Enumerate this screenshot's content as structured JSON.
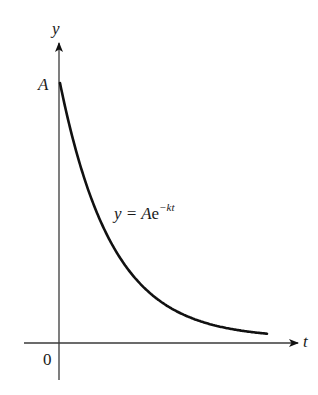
{
  "figure": {
    "y_axis_label": "y",
    "x_axis_label": "t",
    "origin_label": "0",
    "intercept_label": "A",
    "equation": {
      "lhs": "y = A",
      "base": "e",
      "exponent": "−kt"
    }
  },
  "colors": {
    "axis": "#3a3a3a",
    "curve": "#111111",
    "text": "#1a1a1a",
    "background": "#ffffff"
  },
  "chart_data": {
    "type": "line",
    "title": "",
    "xlabel": "t",
    "ylabel": "y",
    "function": "y = A e^(-kt)",
    "annotations": [
      "A (y-intercept)",
      "0 (origin)",
      "y = Ae^{-kt}"
    ],
    "grid": false,
    "legend": "none",
    "series": [
      {
        "name": "y = Ae^{-kt}",
        "description": "exponential decay starting at A on y-axis, approaching t-axis asymptotically",
        "x": [
          0,
          0.25,
          0.5,
          0.75,
          1.0,
          1.25,
          1.5,
          1.75,
          2.0
        ],
        "values": [
          1.0,
          0.62,
          0.38,
          0.24,
          0.15,
          0.09,
          0.06,
          0.03,
          0.02
        ]
      }
    ],
    "pixel_geometry": {
      "origin": [
        59,
        343
      ],
      "y_axis_top": 43,
      "y_axis_bottom": 380,
      "x_axis_left": 24,
      "x_axis_right": 298,
      "curve_start": [
        60,
        83
      ],
      "curve_end_x": 267,
      "decay_per_px": 0.0192
    }
  }
}
